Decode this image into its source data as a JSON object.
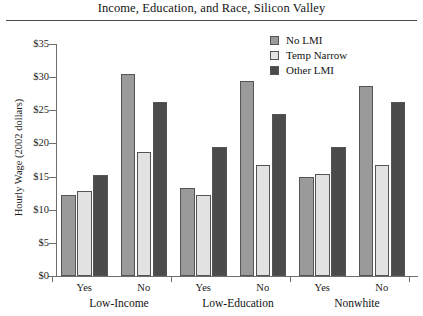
{
  "chart_data": {
    "type": "bar",
    "title": "Income, Education, and Race, Silicon Valley",
    "xlabel": "",
    "ylabel": "Hourly Wage (2002 dollars)",
    "ylim": [
      0,
      35
    ],
    "ytick_labels": [
      "$35",
      "$30",
      "$25",
      "$20",
      "$15",
      "$10",
      "$5",
      "$0"
    ],
    "ytick_values": [
      35,
      30,
      25,
      20,
      15,
      10,
      5,
      0
    ],
    "grid": false,
    "legend_position": "top-right",
    "groups": [
      "Low-Income",
      "Low-Education",
      "Nonwhite"
    ],
    "categories": [
      "Yes",
      "No",
      "Yes",
      "No",
      "Yes",
      "No"
    ],
    "series": [
      {
        "name": "No LMI",
        "color": "#9a9a9a",
        "values": [
          12.2,
          30.5,
          13.3,
          29.4,
          14.9,
          28.6
        ]
      },
      {
        "name": "Temp Narrow",
        "color": "#e2e2e2",
        "values": [
          12.9,
          18.7,
          12.2,
          16.8,
          15.4,
          16.7
        ]
      },
      {
        "name": "Other LMI",
        "color": "#4b4b4b",
        "values": [
          15.3,
          26.2,
          19.4,
          24.4,
          19.5,
          26.2
        ]
      }
    ]
  },
  "legend": {
    "items": [
      {
        "label": "No LMI",
        "swatch": "legend-swatch-no-lmi"
      },
      {
        "label": "Temp Narrow",
        "swatch": "legend-swatch-temp-narrow"
      },
      {
        "label": "Other LMI",
        "swatch": "legend-swatch-other-lmi"
      }
    ]
  }
}
